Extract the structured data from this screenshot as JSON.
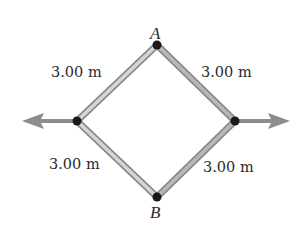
{
  "diagram": {
    "type": "rhombus-rod-frame",
    "vertices": {
      "top": {
        "label": "A",
        "x": 157,
        "y": 45
      },
      "left": {
        "label": "",
        "x": 77,
        "y": 121
      },
      "right": {
        "label": "",
        "x": 235,
        "y": 121
      },
      "bottom": {
        "label": "B",
        "x": 157,
        "y": 197
      }
    },
    "rods": [
      {
        "id": "top-left",
        "length_label": "3.00 m"
      },
      {
        "id": "top-right",
        "length_label": "3.00 m"
      },
      {
        "id": "bottom-left",
        "length_label": "3.00 m"
      },
      {
        "id": "bottom-right",
        "length_label": "3.00 m"
      }
    ],
    "forces": [
      {
        "id": "left-force",
        "direction": "left"
      },
      {
        "id": "right-force",
        "direction": "right"
      }
    ],
    "colors": {
      "rod_fill": "#c4c4c4",
      "rod_edge": "#8a8a8a",
      "arrow": "#8c8c8c",
      "joint": "#1a1a1a",
      "text": "#2a2a2a"
    }
  }
}
